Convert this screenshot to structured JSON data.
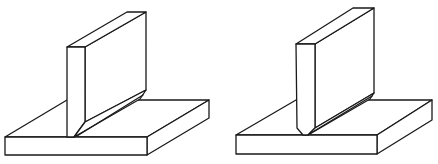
{
  "diagram": {
    "type": "technical line drawing",
    "figures": [
      {
        "id": "left",
        "description": "Vertical plate with square edge standing on base plate, fillet weld along one side",
        "edge_preparation": "square"
      },
      {
        "id": "right",
        "description": "Vertical plate with chamfered (beveled) bottom edge standing on base plate, weld along one side",
        "edge_preparation": "chamfered"
      }
    ],
    "colors": {
      "line": "#1a1a1a",
      "fill": "#ffffff"
    }
  }
}
